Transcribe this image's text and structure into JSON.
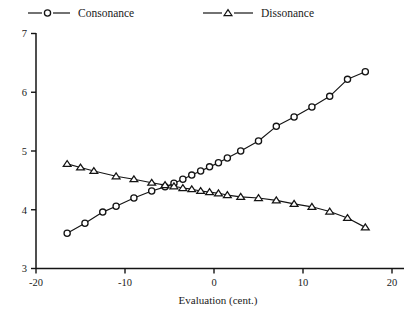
{
  "chart_data": {
    "type": "line",
    "title": "",
    "xlabel": "Evaluation (cent.)",
    "ylabel": "",
    "xlim": [
      -20,
      20
    ],
    "ylim": [
      3,
      7
    ],
    "xticks": [
      -20,
      -10,
      0,
      10,
      20
    ],
    "xtick_labels": [
      "-20",
      "-10",
      "0",
      "10",
      "20"
    ],
    "yticks": [
      3,
      4,
      5,
      6,
      7
    ],
    "ytick_labels": [
      "3",
      "4",
      "5",
      "6",
      "7"
    ],
    "grid": false,
    "legend_position": "top",
    "line_color": "#141414",
    "background": "#ffffff",
    "series": [
      {
        "name": "Consonance",
        "marker": "circle",
        "x": [
          -16.5,
          -14.5,
          -12.5,
          -11.0,
          -9.0,
          -7.0,
          -5.5,
          -4.5,
          -3.5,
          -2.5,
          -1.5,
          -0.5,
          0.5,
          1.5,
          3.0,
          5.0,
          7.0,
          9.0,
          11.0,
          13.0,
          15.0,
          17.0
        ],
        "y": [
          3.6,
          3.77,
          3.96,
          4.06,
          4.2,
          4.32,
          4.39,
          4.45,
          4.52,
          4.59,
          4.66,
          4.73,
          4.8,
          4.88,
          5.0,
          5.17,
          5.42,
          5.58,
          5.75,
          5.93,
          6.22,
          6.35
        ]
      },
      {
        "name": "Dissonance",
        "marker": "triangle",
        "x": [
          -16.5,
          -15.0,
          -13.5,
          -11.0,
          -9.0,
          -7.0,
          -5.5,
          -4.5,
          -3.5,
          -2.5,
          -1.5,
          -0.5,
          0.5,
          1.5,
          3.0,
          5.0,
          7.0,
          9.0,
          11.0,
          13.0,
          15.0,
          17.0
        ],
        "y": [
          4.78,
          4.72,
          4.66,
          4.57,
          4.52,
          4.46,
          4.42,
          4.4,
          4.37,
          4.35,
          4.32,
          4.3,
          4.28,
          4.25,
          4.22,
          4.2,
          4.16,
          4.1,
          4.05,
          3.97,
          3.86,
          3.7
        ]
      }
    ],
    "legend": [
      {
        "label": "Consonance",
        "marker": "circle"
      },
      {
        "label": "Dissonance",
        "marker": "triangle"
      }
    ]
  }
}
